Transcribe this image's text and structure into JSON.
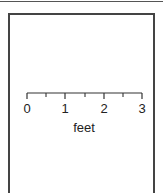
{
  "figure": {
    "type": "scale-bar",
    "unit_label": "feet",
    "range": [
      0,
      3
    ],
    "major_ticks": [
      {
        "value": 0,
        "label": "0",
        "x": 27
      },
      {
        "value": 1,
        "label": "1",
        "x": 65
      },
      {
        "value": 2,
        "label": "2",
        "x": 104
      },
      {
        "value": 3,
        "label": "3",
        "x": 142
      }
    ],
    "minor_ticks": [
      {
        "value": 0.5,
        "x": 46
      },
      {
        "value": 1.5,
        "x": 85
      },
      {
        "value": 2.5,
        "x": 123
      }
    ],
    "colors": {
      "line": "#333333",
      "frame": "#444444",
      "text": "#222222",
      "background": "#ffffff"
    }
  }
}
